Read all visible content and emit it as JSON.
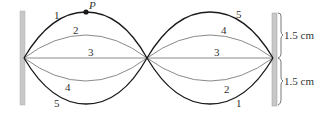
{
  "diagram": {
    "point_label": "P",
    "curve_labels": {
      "left": {
        "top_outer": "1",
        "top_inner": "2",
        "middle": "3",
        "bottom_inner": "4",
        "bottom_outer": "5"
      },
      "right": {
        "top_outer": "5",
        "top_inner": "4",
        "middle": "3",
        "bottom_inner": "2",
        "bottom_outer": "1"
      }
    },
    "dimensions": {
      "upper": "1.5 cm",
      "lower": "1.5 cm"
    },
    "colors": {
      "dark_curve": "#1a1a1a",
      "gray_curve": "#8a8a8a",
      "wall": "#c8c8c8",
      "wall_edge": "#9a9a9a"
    }
  }
}
